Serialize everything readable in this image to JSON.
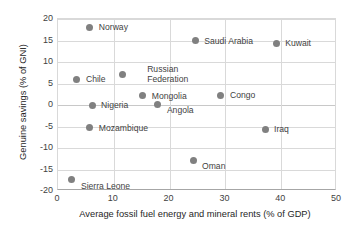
{
  "chart_data": {
    "type": "scatter",
    "title": "",
    "xlabel": "Average fossil fuel energy and mineral rents (% of GDP)",
    "ylabel": "Genuine savings (% of GNI)",
    "xlim": [
      0,
      50
    ],
    "ylim": [
      -20,
      20
    ],
    "xticks": [
      "0",
      "10",
      "20",
      "30",
      "40",
      "50"
    ],
    "yticks": [
      "20",
      "15",
      "10",
      "5",
      "0",
      "-5",
      "-10",
      "-15",
      "-20"
    ],
    "grid": true,
    "legend": "none",
    "marker_color": "#808080",
    "points": [
      {
        "label": "Norway",
        "x": 5.7,
        "y": 18.1,
        "label_dx": 9,
        "label_dy": -5
      },
      {
        "label": "Saudi Arabia",
        "x": 24.6,
        "y": 14.9,
        "label_dx": 9,
        "label_dy": -5
      },
      {
        "label": "Kuwait",
        "x": 39.1,
        "y": 14.4,
        "label_dx": 9,
        "label_dy": -5
      },
      {
        "label": "Russian Federation",
        "x": 11.5,
        "y": 7.0,
        "label_dx": 25,
        "label_dy": -11
      },
      {
        "label": "Chile",
        "x": 3.4,
        "y": 6.0,
        "label_dx": 9,
        "label_dy": -5
      },
      {
        "label": "Mongolia",
        "x": 15.2,
        "y": 2.1,
        "label_dx": 9,
        "label_dy": -5
      },
      {
        "label": "Congo",
        "x": 29.2,
        "y": 2.3,
        "label_dx": 9,
        "label_dy": -5
      },
      {
        "label": "Angola",
        "x": 17.9,
        "y": 0.2,
        "label_dx": 9,
        "label_dy": 1
      },
      {
        "label": "Nigeria",
        "x": 6.1,
        "y": 0.0,
        "label_dx": 9,
        "label_dy": -5
      },
      {
        "label": "Mozambique",
        "x": 5.7,
        "y": -5.3,
        "label_dx": 9,
        "label_dy": -5
      },
      {
        "label": "Iraq",
        "x": 37.1,
        "y": -5.6,
        "label_dx": 9,
        "label_dy": -5
      },
      {
        "label": "Oman",
        "x": 24.2,
        "y": -12.8,
        "label_dx": 9,
        "label_dy": 1
      },
      {
        "label": "Sierra Leone",
        "x": 2.5,
        "y": -17.4,
        "label_dx": 9,
        "label_dy": 1
      }
    ]
  }
}
